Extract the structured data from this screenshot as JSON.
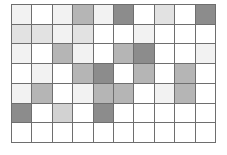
{
  "chart_data": {
    "type": "heatmap",
    "title": "",
    "subtitle": "",
    "xlabel": "",
    "ylabel": "",
    "legend": [],
    "annotations": [],
    "grid": true,
    "gridline_color": "#6e6e6e",
    "background_color": "#ffffff",
    "n_columns": 10,
    "n_rows": 7,
    "x": [
      1,
      2,
      3,
      4,
      5,
      6,
      7,
      8,
      9,
      10
    ],
    "y": [
      1,
      2,
      3,
      4,
      5,
      6,
      7
    ],
    "xtick_labels": [],
    "ytick_labels": [],
    "xlim": [
      0,
      10
    ],
    "ylim": [
      0,
      7
    ],
    "shade_levels": {
      "white": "#ffffff",
      "very-light": "#f2f2f2",
      "light": "#e2e2e2",
      "medium-light": "#d2d2d2",
      "medium": "#b5b5b5",
      "dark": "#8c8c8c"
    },
    "shade_values": {
      "white": 0,
      "very-light": 1,
      "light": 2,
      "medium-light": 3,
      "medium": 4,
      "dark": 5
    },
    "rows": [
      {
        "row_index": 1,
        "shades": [
          "very-light",
          "white",
          "very-light",
          "medium",
          "very-light",
          "dark",
          "white",
          "light",
          "white",
          "dark"
        ],
        "values": [
          1,
          0,
          1,
          4,
          1,
          5,
          0,
          2,
          0,
          5
        ]
      },
      {
        "row_index": 2,
        "shades": [
          "light",
          "light",
          "very-light",
          "light",
          "white",
          "white",
          "very-light",
          "white",
          "white",
          "white"
        ],
        "values": [
          2,
          2,
          1,
          2,
          0,
          0,
          1,
          0,
          0,
          0
        ]
      },
      {
        "row_index": 3,
        "shades": [
          "very-light",
          "white",
          "medium",
          "very-light",
          "white",
          "medium",
          "dark",
          "white",
          "white",
          "very-light"
        ],
        "values": [
          1,
          0,
          4,
          1,
          0,
          4,
          5,
          0,
          0,
          1
        ]
      },
      {
        "row_index": 4,
        "shades": [
          "white",
          "very-light",
          "white",
          "medium",
          "dark",
          "white",
          "medium",
          "white",
          "medium",
          "white"
        ],
        "values": [
          0,
          1,
          0,
          4,
          5,
          0,
          4,
          0,
          4,
          0
        ]
      },
      {
        "row_index": 5,
        "shades": [
          "very-light",
          "medium",
          "white",
          "very-light",
          "medium",
          "medium",
          "white",
          "very-light",
          "medium",
          "white"
        ],
        "values": [
          1,
          4,
          0,
          1,
          4,
          4,
          0,
          1,
          4,
          0
        ]
      },
      {
        "row_index": 6,
        "shades": [
          "dark",
          "white",
          "medium-light",
          "white",
          "dark",
          "white",
          "white",
          "white",
          "white",
          "white"
        ],
        "values": [
          5,
          0,
          3,
          0,
          5,
          0,
          0,
          0,
          0,
          0
        ]
      },
      {
        "row_index": 7,
        "shades": [
          "white",
          "white",
          "white",
          "white",
          "white",
          "white",
          "white",
          "white",
          "white",
          "white"
        ],
        "values": [
          0,
          0,
          0,
          0,
          0,
          0,
          0,
          0,
          0,
          0
        ]
      }
    ]
  }
}
